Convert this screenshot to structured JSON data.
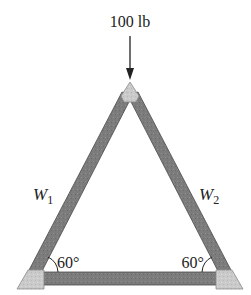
{
  "diagram": {
    "type": "truss",
    "load": {
      "label": "100 lb",
      "direction": "down"
    },
    "members": [
      {
        "id": "W1",
        "label_main": "W",
        "label_sub": "1",
        "side": "left"
      },
      {
        "id": "W2",
        "label_main": "W",
        "label_sub": "2",
        "side": "right"
      },
      {
        "id": "base",
        "side": "bottom"
      }
    ],
    "angles": [
      {
        "label": "60°",
        "corner": "bottom-left"
      },
      {
        "label": "60°",
        "corner": "bottom-right"
      }
    ],
    "colors": {
      "member": "#7a7a7a",
      "member_edge": "#4a4a4a",
      "gusset": "#c9c9c9",
      "gusset_edge": "#8a8a8a",
      "text": "#222222"
    }
  }
}
